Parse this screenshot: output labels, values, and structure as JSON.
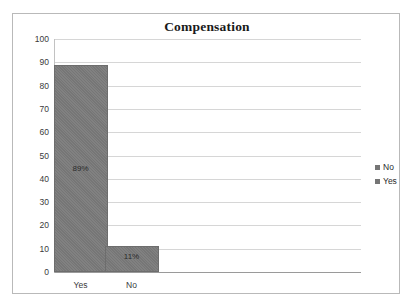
{
  "page": {
    "top_cutoff_text": "·   ·   ·  ·  ·    ·   ·    ·     ·  ·  ·   ·    ·  ·"
  },
  "chart_data": {
    "type": "bar",
    "title": "Compensation",
    "xlabel": "",
    "ylabel": "",
    "categories": [
      "Yes",
      "No"
    ],
    "values": [
      89,
      11
    ],
    "data_labels": [
      "89%",
      "11%"
    ],
    "ylim": [
      0,
      100
    ],
    "yticks": [
      0,
      10,
      20,
      30,
      40,
      50,
      60,
      70,
      80,
      90,
      100
    ],
    "ytick_labels": [
      "0",
      "10",
      "20",
      "30",
      "40",
      "50",
      "60",
      "70",
      "80",
      "90",
      "100"
    ],
    "grid": true,
    "legend": {
      "position": "right",
      "entries": [
        {
          "label": "No",
          "color": "#757575"
        },
        {
          "label": "Yes",
          "color": "#757575"
        }
      ]
    },
    "series": [
      {
        "name": "Compensation",
        "values": [
          89,
          11
        ],
        "color": "#7b7b7b"
      }
    ],
    "colors": {
      "bar": "#7b7b7b",
      "bar_border": "#6d6d6d",
      "gridline": "#d6d6d6",
      "axis": "#9a9a9a",
      "frame": "#b9b9b9",
      "title_text": "#1a1a1a",
      "tick_text": "#3a3a3a"
    }
  }
}
